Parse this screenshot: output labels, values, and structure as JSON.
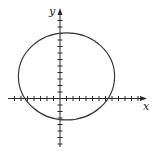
{
  "figure": {
    "type": "graph-of-curve",
    "axes": {
      "x_label": "x",
      "y_label": "y",
      "x_range": [
        -7,
        13
      ],
      "y_range": [
        -7,
        13
      ],
      "tick_step": 1
    },
    "curve": {
      "kind": "ellipse",
      "center": [
        1,
        3.4
      ],
      "semi_axis_x": 7.4,
      "semi_axis_y": 6.7
    },
    "colors": {
      "axis": "#2a2a2a",
      "curve": "#3a3a3a",
      "background": "#ffffff"
    }
  }
}
